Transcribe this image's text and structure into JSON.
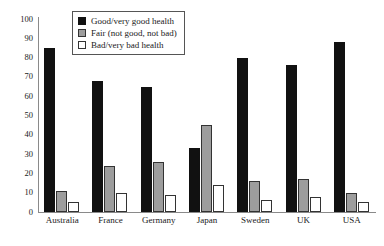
{
  "chart_data": {
    "type": "bar",
    "title": "",
    "xlabel": "",
    "ylabel": "",
    "ylim": [
      0,
      100
    ],
    "yticks": [
      0,
      10,
      20,
      30,
      40,
      50,
      60,
      70,
      80,
      90,
      100
    ],
    "grid": false,
    "legend_position": "top-center",
    "categories": [
      "Australia",
      "France",
      "Germany",
      "Japan",
      "Sweden",
      "UK",
      "USA"
    ],
    "series": [
      {
        "name": "Good/very good health",
        "color": "#111111",
        "values": [
          85,
          68,
          65,
          33,
          80,
          76,
          88
        ]
      },
      {
        "name": "Fair (not good, not bad)",
        "color": "#9d9d9d",
        "values": [
          11,
          24,
          26,
          45,
          16,
          17,
          10
        ]
      },
      {
        "name": "Bad/very bad health",
        "color": "#ffffff",
        "values": [
          5,
          10,
          9,
          14,
          6,
          8,
          5
        ]
      }
    ]
  }
}
